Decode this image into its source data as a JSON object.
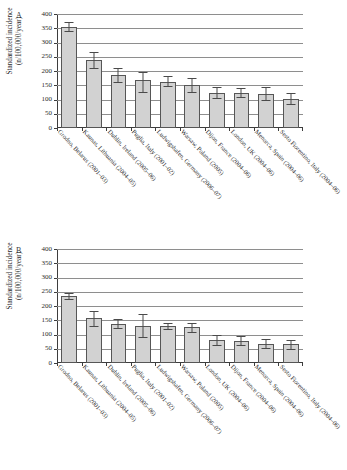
{
  "figure": {
    "panels": [
      {
        "letter": "A"
      },
      {
        "letter": "B"
      }
    ],
    "axis_title_line1": "Standardized incidence",
    "axis_title_line2": "(n/100,000/year)"
  },
  "chart_data": [
    {
      "type": "bar",
      "panel": "A",
      "title": "",
      "xlabel": "",
      "ylabel": "Standardized incidence (n/100,000/year)",
      "ylim": [
        0,
        400
      ],
      "yticks": [
        0,
        50,
        100,
        150,
        200,
        250,
        300,
        350,
        400
      ],
      "grid": true,
      "legend": "none",
      "bar_color": "#d2d2d2",
      "bar_edge_color": "#565656",
      "error_bars": true,
      "categories": [
        "Grodno, Belarus (2001–03)",
        "Kaunas, Lithuania (2004–05)",
        "Dublin, Ireland (2005–06)",
        "Puglia, Italy (2001–02)",
        "Ludwigshafen, Germany (2006–07)",
        "Warsaw, Poland (2005)",
        "Dijon, France (2004–06)",
        "London, UK (2004–06)",
        "Menorca, Spain (2004–06)",
        "Sesto Fiorentino, Italy (2004–06)"
      ],
      "values": [
        355,
        238,
        185,
        170,
        163,
        151,
        124,
        123,
        118,
        103
      ],
      "ci_low": [
        339,
        212,
        160,
        128,
        147,
        128,
        106,
        108,
        97,
        85
      ],
      "ci_high": [
        372,
        266,
        212,
        197,
        182,
        175,
        144,
        140,
        143,
        122
      ]
    },
    {
      "type": "bar",
      "panel": "B",
      "title": "",
      "xlabel": "",
      "ylabel": "Standardized incidence (n/100,000/year)",
      "ylim": [
        0,
        400
      ],
      "yticks": [
        0,
        50,
        100,
        150,
        200,
        250,
        300,
        350,
        400
      ],
      "grid": true,
      "legend": "none",
      "bar_color": "#d2d2d2",
      "bar_edge_color": "#565656",
      "error_bars": true,
      "categories": [
        "Grodno, Belarus (2001–03)",
        "Kaunas, Lithuania (2004–05)",
        "Dublin, Ireland (2005–06)",
        "Puglia, Italy (2001–02)",
        "Ludwigshafen, Germany (2006–07)",
        "Warsaw, Poland (2005)",
        "London, UK (2004–06)",
        "Dijon, France (2004–06)",
        "Menorca, Spain (2004–06)",
        "Sesto Fiorentino, Italy (2004–06)"
      ],
      "values": [
        235,
        157,
        138,
        131,
        129,
        125,
        81,
        77,
        68,
        65
      ],
      "ci_low": [
        225,
        131,
        122,
        90,
        118,
        108,
        63,
        62,
        54,
        50
      ],
      "ci_high": [
        246,
        183,
        155,
        172,
        141,
        142,
        99,
        93,
        83,
        81
      ]
    }
  ]
}
